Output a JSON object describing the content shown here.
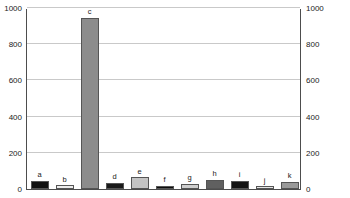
{
  "chart_data": {
    "type": "bar",
    "title": "",
    "subtitle": "",
    "xlabel": "",
    "ylabel": "",
    "categories": [
      "a",
      "b",
      "c",
      "d",
      "e",
      "f",
      "g",
      "h",
      "i",
      "j",
      "k"
    ],
    "values": [
      45,
      22,
      945,
      35,
      65,
      18,
      30,
      50,
      45,
      15,
      40
    ],
    "bar_colors": [
      "#111111",
      "#ededed",
      "#8c8c8c",
      "#1a1a1a",
      "#c4c4c4",
      "#0d0d0d",
      "#cfcfcf",
      "#606060",
      "#141414",
      "#e6e6e6",
      "#9a9a9a"
    ],
    "ylim": [
      0,
      1000
    ],
    "yticks": [
      0,
      200,
      400,
      600,
      800,
      1000
    ],
    "left_axis_labels": [
      "1000",
      "800",
      "600",
      "400",
      "200",
      "0"
    ],
    "right_axis_labels": [
      "1000",
      "800",
      "600",
      "400",
      "200",
      "0"
    ],
    "grid": true,
    "grid_axis": "y",
    "legend": false,
    "legend_position": "none",
    "dual_axis": true,
    "bar_labels_on_top": true
  }
}
